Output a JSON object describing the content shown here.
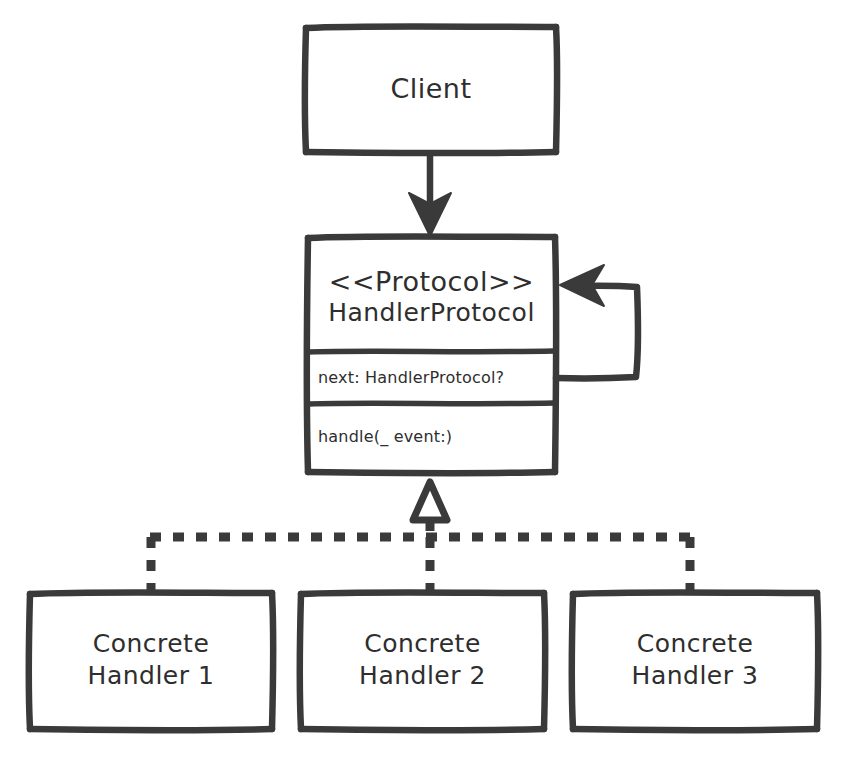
{
  "diagram": {
    "style": "hand-drawn",
    "stroke_color": "#3a3a3a",
    "background_color": "#ffffff",
    "nodes": {
      "client": {
        "label": "Client",
        "x": 305,
        "y": 26,
        "w": 252,
        "h": 127
      },
      "handler_protocol": {
        "stereotype": "<<Protocol>>",
        "name": "HandlerProtocol",
        "attribute": "next: HandlerProtocol?",
        "method": "handle(_ event:)",
        "x": 307,
        "y": 236,
        "w": 249,
        "h": 237
      },
      "concrete_handler_1": {
        "line1": "Concrete",
        "line2": "Handler 1",
        "x": 29,
        "y": 592,
        "w": 244,
        "h": 138
      },
      "concrete_handler_2": {
        "line1": "Concrete",
        "line2": "Handler 2",
        "x": 300,
        "y": 592,
        "w": 245,
        "h": 138
      },
      "concrete_handler_3": {
        "line1": "Concrete",
        "line2": "Handler 3",
        "x": 572,
        "y": 592,
        "w": 246,
        "h": 138
      }
    },
    "edges": {
      "client_to_protocol": {
        "type": "association",
        "arrowhead": "filled-solid",
        "from": "client",
        "to": "handler_protocol"
      },
      "protocol_self_loop": {
        "type": "self-association",
        "arrowhead": "filled-solid",
        "from": "handler_protocol.next",
        "to": "handler_protocol"
      },
      "realization_bus": {
        "type": "realization",
        "line_style": "dashed",
        "arrowhead": "hollow-triangle",
        "from": [
          "concrete_handler_1",
          "concrete_handler_2",
          "concrete_handler_3"
        ],
        "to": "handler_protocol"
      }
    }
  }
}
